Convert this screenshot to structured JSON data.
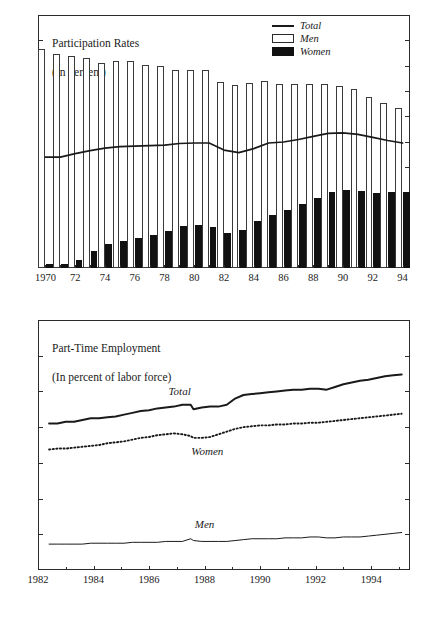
{
  "figure": {
    "width": 427,
    "height": 618,
    "background": "#ffffff",
    "line_color": "#1a1a1a",
    "bar_men_fill": "#ffffff",
    "bar_men_stroke": "#3a3a3a",
    "bar_women_fill": "#111111"
  },
  "chart_data": [
    {
      "type": "bar",
      "id": "participation-rates",
      "title": "Participation Rates",
      "subtitle": "(In percent)",
      "xlabel": "",
      "ylabel": "",
      "ylim": [
        50,
        100
      ],
      "yticks": [
        50,
        55,
        60,
        65,
        70,
        75,
        80,
        85,
        90,
        95,
        100
      ],
      "ytick_labels": [
        "50",
        "55",
        "60",
        "65",
        "70",
        "75",
        "80",
        "85",
        "90",
        "95",
        "100"
      ],
      "grid": false,
      "legend_position": "top-right",
      "legend": [
        "Total",
        "Men",
        "Women"
      ],
      "categories": [
        1970,
        1971,
        1972,
        1973,
        1974,
        1975,
        1976,
        1977,
        1978,
        1979,
        1980,
        1981,
        1982,
        1983,
        1984,
        1985,
        1986,
        1987,
        1988,
        1989,
        1990,
        1991,
        1992,
        1993,
        1994
      ],
      "xtick_labels": [
        "1970",
        "72",
        "74",
        "76",
        "78",
        "80",
        "82",
        "84",
        "86",
        "88",
        "90",
        "92",
        "94"
      ],
      "xtick_values": [
        1970,
        1972,
        1974,
        1976,
        1978,
        1980,
        1982,
        1984,
        1986,
        1988,
        1990,
        1992,
        1994
      ],
      "series": [
        {
          "name": "Men",
          "style": "bar-open",
          "values": [
            93.2,
            92.3,
            91.8,
            91.6,
            90.5,
            90.9,
            90.9,
            90.1,
            90.0,
            89.2,
            89.2,
            89.1,
            86.8,
            86.1,
            86.6,
            87.0,
            86.3,
            86.3,
            86.3,
            86.3,
            86.0,
            85.4,
            83.8,
            82.7,
            81.6
          ]
        },
        {
          "name": "Women",
          "style": "bar-solid",
          "values": [
            50.7,
            50.8,
            51.5,
            53.4,
            54.7,
            55.4,
            56.0,
            56.6,
            57.4,
            58.3,
            58.5,
            58.1,
            56.9,
            57.5,
            59.2,
            60.5,
            61.4,
            62.6,
            63.9,
            65.1,
            65.5,
            65.2,
            64.9,
            65.0,
            65.0
          ]
        },
        {
          "name": "Total",
          "style": "line",
          "values": [
            71.9,
            71.9,
            72.6,
            73.2,
            73.7,
            74.0,
            74.1,
            74.2,
            74.3,
            74.6,
            74.7,
            74.7,
            73.3,
            72.8,
            73.6,
            74.7,
            74.9,
            75.4,
            76.0,
            76.6,
            76.7,
            76.4,
            75.8,
            75.2,
            74.7
          ]
        }
      ]
    },
    {
      "type": "line",
      "id": "part-time-employment",
      "title": "Part-Time Employment",
      "subtitle": "(In percent of labor force)",
      "xlabel": "",
      "ylabel": "",
      "ylim": [
        0,
        28
      ],
      "yticks": [
        0,
        4,
        8,
        12,
        16,
        20,
        24,
        28
      ],
      "ytick_labels": [
        "0",
        "4",
        "8",
        "12",
        "16",
        "20",
        "24",
        "28"
      ],
      "xlim": [
        1982,
        1995.4
      ],
      "xtick_labels": [
        "1982",
        "1984",
        "1986",
        "1988",
        "1990",
        "1992",
        "1994"
      ],
      "xtick_values": [
        1982,
        1984,
        1986,
        1988,
        1990,
        1992,
        1994
      ],
      "grid": false,
      "annotations": [
        {
          "text": "Total",
          "x": 1987.1,
          "y": 20.1
        },
        {
          "text": "Women",
          "x": 1988.1,
          "y": 13.3
        },
        {
          "text": "Men",
          "x": 1988.0,
          "y": 5.1
        }
      ],
      "x": [
        1982.4,
        1982.7,
        1983.0,
        1983.3,
        1983.6,
        1983.9,
        1984.2,
        1984.5,
        1984.8,
        1985.1,
        1985.4,
        1985.7,
        1986.0,
        1986.3,
        1986.6,
        1986.9,
        1987.2,
        1987.5,
        1987.6,
        1987.9,
        1988.2,
        1988.5,
        1988.8,
        1989.1,
        1989.4,
        1989.7,
        1990.0,
        1990.3,
        1990.6,
        1990.9,
        1991.2,
        1991.5,
        1991.8,
        1992.1,
        1992.4,
        1992.7,
        1993.0,
        1993.3,
        1993.6,
        1993.9,
        1994.2,
        1994.5,
        1994.8,
        1995.1
      ],
      "series": [
        {
          "name": "Total",
          "style": "solid-thick",
          "values": [
            16.4,
            16.4,
            16.6,
            16.6,
            16.8,
            17.0,
            17.0,
            17.1,
            17.2,
            17.4,
            17.6,
            17.8,
            17.9,
            18.1,
            18.2,
            18.3,
            18.5,
            18.5,
            18.0,
            18.2,
            18.3,
            18.3,
            18.5,
            19.2,
            19.6,
            19.7,
            19.8,
            19.9,
            20.0,
            20.1,
            20.2,
            20.2,
            20.3,
            20.3,
            20.2,
            20.5,
            20.8,
            21.0,
            21.2,
            21.3,
            21.5,
            21.7,
            21.8,
            21.9
          ]
        },
        {
          "name": "Women",
          "style": "dotted",
          "values": [
            13.5,
            13.6,
            13.6,
            13.7,
            13.8,
            13.9,
            14.0,
            14.2,
            14.3,
            14.4,
            14.6,
            14.8,
            14.9,
            15.1,
            15.2,
            15.3,
            15.2,
            15.0,
            14.8,
            14.8,
            14.9,
            15.2,
            15.5,
            15.8,
            16.0,
            16.1,
            16.2,
            16.2,
            16.3,
            16.3,
            16.4,
            16.4,
            16.5,
            16.5,
            16.6,
            16.7,
            16.8,
            16.9,
            17.0,
            17.1,
            17.2,
            17.3,
            17.4,
            17.5
          ]
        },
        {
          "name": "Men",
          "style": "solid-thin",
          "values": [
            2.9,
            2.9,
            2.9,
            2.9,
            2.9,
            3.0,
            3.0,
            3.0,
            3.0,
            3.0,
            3.1,
            3.1,
            3.1,
            3.1,
            3.2,
            3.2,
            3.2,
            3.5,
            3.3,
            3.2,
            3.2,
            3.2,
            3.2,
            3.3,
            3.4,
            3.5,
            3.5,
            3.5,
            3.5,
            3.6,
            3.6,
            3.6,
            3.7,
            3.7,
            3.6,
            3.6,
            3.7,
            3.7,
            3.7,
            3.8,
            3.9,
            4.0,
            4.1,
            4.2
          ]
        }
      ]
    }
  ]
}
